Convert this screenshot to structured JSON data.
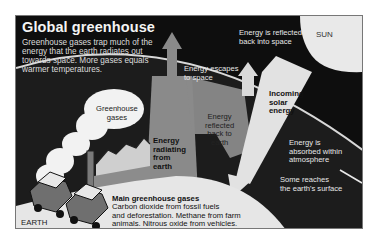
{
  "diagram": {
    "title": "Global greenhouse",
    "intro": "Greenhouse gases trap much of the energy that the earth radiates out towards space. More gases equals warmer temperatures.",
    "labels": {
      "sun": "SUN",
      "reflected_into_space": [
        "Energy is reflected",
        "back into space"
      ],
      "escapes_to_space": [
        "Energy escapes",
        "to space"
      ],
      "greenhouse_gases": [
        "Greenhouse",
        "gases"
      ],
      "incoming_solar": [
        "Incoming",
        "solar",
        "energy"
      ],
      "reflected_to_earth": [
        "Energy",
        "reflected",
        "back to",
        "earth"
      ],
      "radiating_from_earth": [
        "Energy",
        "radiating",
        "from",
        "earth"
      ],
      "absorbed_in_atmosphere": [
        "Energy is",
        "absorbed within",
        "atmosphere"
      ],
      "reaches_surface": [
        "Some reaches",
        "the earth's surface"
      ],
      "earth": "EARTH"
    },
    "main_gases": {
      "heading": "Main greenhouse gases",
      "lines": [
        "Carbon dioxide from fossil fuels",
        "and deforestation. Methane from farm",
        "animals. Nitrous oxide from vehicles."
      ]
    },
    "icons": [
      "sun-shape",
      "factory-icon",
      "car-icon",
      "smoke-cloud",
      "arrow-up",
      "arrow-down"
    ],
    "colors": {
      "space": "#0e0e0e",
      "atmosphere": "#1c1c1c",
      "earth_ground": "#e6e6e6",
      "energy_arrow": "#8c8c8c",
      "solar_arrow": "#e2e2e2",
      "sun": "#e9e9e9"
    }
  }
}
